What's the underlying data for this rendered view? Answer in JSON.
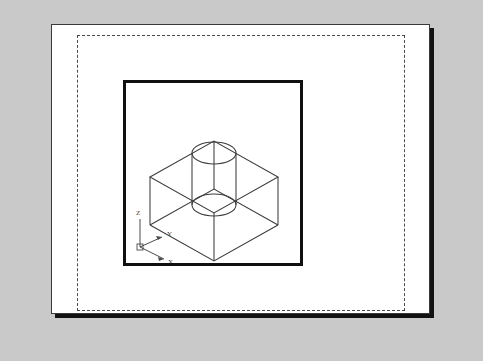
{
  "application": {
    "view_mode": "Paper Space Layout",
    "background_color": "#c9c9c9",
    "paper_color": "#ffffff"
  },
  "paper": {
    "label": "layout-sheet",
    "border_color": "#3a3a3a",
    "shadow_color": "#121212"
  },
  "printable_area": {
    "label": "printable-area-boundary",
    "style": "dashed",
    "color": "#4a4a4a"
  },
  "viewport": {
    "label": "model-space-viewport",
    "border_color": "#101010",
    "border_width_px": 3
  },
  "ucs_icon": {
    "label": "ucs-coordinate-icon",
    "axes": [
      {
        "name": "z-axis",
        "label": "Z"
      },
      {
        "name": "y-axis",
        "label": "Y"
      },
      {
        "name": "x-axis",
        "label": "X"
      }
    ],
    "color": "#4a4a4a"
  },
  "model": {
    "name": "isometric-block-with-through-hole",
    "description": "Rectangular wireframe block in isometric view with a vertical cylindrical through hole",
    "line_color": "#3c3c3c",
    "geometry": {
      "box_vertices": {
        "front_bottom_left": [
          24,
          142
        ],
        "front_bottom_right": [
          88,
          178
        ],
        "back_bottom_right": [
          152,
          142
        ],
        "back_bottom_left": [
          88,
          106
        ],
        "front_top_left": [
          24,
          94
        ],
        "front_top_right": [
          88,
          130
        ],
        "back_top_right": [
          152,
          94
        ],
        "back_top_left": [
          88,
          58
        ]
      },
      "cylinder": {
        "center_x": 88,
        "top_ellipse_cy": 70,
        "bottom_ellipse_cy": 122,
        "rx": 22,
        "ry": 11
      }
    }
  }
}
